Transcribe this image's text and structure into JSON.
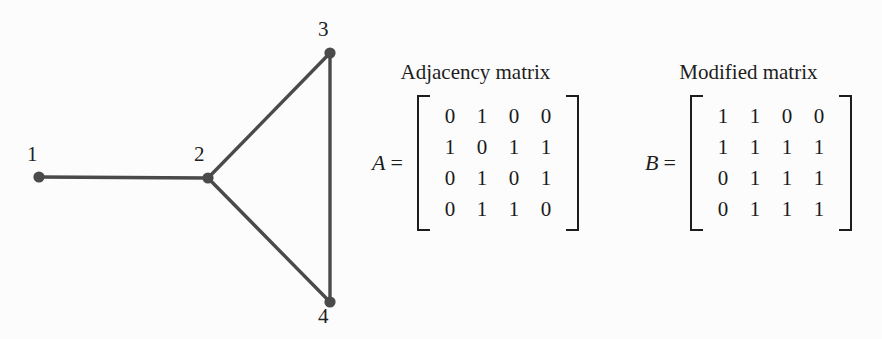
{
  "figure": {
    "background_color": "#fcfcfc",
    "ink_color": "#3f3f3f"
  },
  "graph": {
    "name": "undirected-graph",
    "edge_color": "#4a4a4a",
    "node_color": "#4a4a4a",
    "nodes": [
      {
        "id": "1",
        "label": "1",
        "x": 39,
        "y": 177,
        "label_x": 27,
        "label_y": 144
      },
      {
        "id": "2",
        "label": "2",
        "x": 208,
        "y": 178,
        "label_x": 194,
        "label_y": 144
      },
      {
        "id": "3",
        "label": "3",
        "x": 330,
        "y": 53,
        "label_x": 318,
        "label_y": 19
      },
      {
        "id": "4",
        "label": "4",
        "x": 330,
        "y": 302,
        "label_x": 318,
        "label_y": 306
      }
    ],
    "edges": [
      {
        "from": "1",
        "to": "2"
      },
      {
        "from": "2",
        "to": "3"
      },
      {
        "from": "2",
        "to": "4"
      },
      {
        "from": "3",
        "to": "4"
      }
    ]
  },
  "matrices": [
    {
      "key": "adjacency",
      "caption": "Adjacency matrix",
      "name": "A",
      "equals": "=",
      "rows": [
        [
          "0",
          "1",
          "0",
          "0"
        ],
        [
          "1",
          "0",
          "1",
          "1"
        ],
        [
          "0",
          "1",
          "0",
          "1"
        ],
        [
          "0",
          "1",
          "1",
          "0"
        ]
      ]
    },
    {
      "key": "modified",
      "caption": "Modified matrix",
      "name": "B",
      "equals": "=",
      "rows": [
        [
          "1",
          "1",
          "0",
          "0"
        ],
        [
          "1",
          "1",
          "1",
          "1"
        ],
        [
          "0",
          "1",
          "1",
          "1"
        ],
        [
          "0",
          "1",
          "1",
          "1"
        ]
      ]
    }
  ]
}
